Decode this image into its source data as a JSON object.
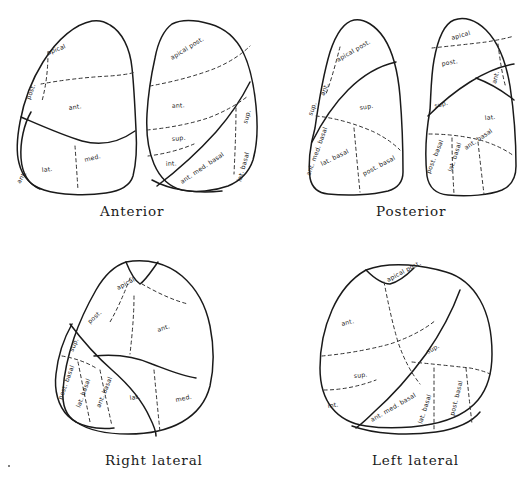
{
  "figure": {
    "background_color": "#ffffff",
    "ink_color": "#1a1a1a"
  },
  "views": [
    {
      "id": "anterior",
      "caption": "Anterior",
      "lungs": [
        {
          "side": "right-lung-as-drawn-left",
          "segments": [
            {
              "name": "apical",
              "label": "apical",
              "x": 62,
              "y": 52,
              "rot": -22
            },
            {
              "name": "posterior",
              "label": "post.",
              "x": 31,
              "y": 97,
              "rot": -68
            },
            {
              "name": "anterior",
              "label": "ant.",
              "x": 78,
              "y": 108,
              "rot": -8
            },
            {
              "name": "lateral",
              "label": "lat.",
              "x": 50,
              "y": 170,
              "rot": -6
            },
            {
              "name": "medial",
              "label": "med.",
              "x": 91,
              "y": 160,
              "rot": -14
            },
            {
              "name": "anterior-basal",
              "label": "ant.",
              "x": 22,
              "y": 178,
              "rot": -58
            }
          ]
        },
        {
          "side": "left-lung-as-drawn-right",
          "segments": [
            {
              "name": "apical-posterior",
              "label": "apical post.",
              "x": 185,
              "y": 48,
              "rot": -30
            },
            {
              "name": "anterior",
              "label": "ant.",
              "x": 182,
              "y": 106,
              "rot": -4
            },
            {
              "name": "superior-lingula",
              "label": "sup.",
              "x": 182,
              "y": 139,
              "rot": -5
            },
            {
              "name": "inferior-lingula",
              "label": "int.",
              "x": 173,
              "y": 163,
              "rot": -4
            },
            {
              "name": "anterior-medial-basal",
              "label": "ant. med. basal",
              "x": 196,
              "y": 175,
              "rot": -22
            },
            {
              "name": "lateral-basal",
              "label": "lat. basal",
              "x": 243,
              "y": 160,
              "rot": -70
            },
            {
              "name": "superior-basal",
              "label": "sup.",
              "x": 245,
              "y": 112,
              "rot": -72
            }
          ]
        }
      ]
    },
    {
      "id": "posterior",
      "caption": "Posterior",
      "lungs": [
        {
          "side": "left-lung-as-drawn-left",
          "segments": [
            {
              "name": "apical-posterior",
              "label": "apical post.",
              "x": 345,
              "y": 52,
              "rot": -28
            },
            {
              "name": "anterior",
              "label": "ant.",
              "x": 325,
              "y": 90,
              "rot": -66
            },
            {
              "name": "superior",
              "label": "sup.",
              "x": 364,
              "y": 105,
              "rot": -10
            },
            {
              "name": "superior-basal",
              "label": "sup.",
              "x": 310,
              "y": 110,
              "rot": -68
            },
            {
              "name": "anterior-medial-basal",
              "label": "ant. med. basal",
              "x": 307,
              "y": 140,
              "rot": -66
            },
            {
              "name": "lateral-basal",
              "label": "lat. basal",
              "x": 331,
              "y": 160,
              "rot": -24
            },
            {
              "name": "posterior-basal",
              "label": "post. basal",
              "x": 372,
              "y": 166,
              "rot": -28
            }
          ]
        },
        {
          "side": "right-lung-as-drawn-right",
          "segments": [
            {
              "name": "apical",
              "label": "apical",
              "x": 438,
              "y": 36,
              "rot": -16
            },
            {
              "name": "posterior",
              "label": "post.",
              "x": 430,
              "y": 62,
              "rot": -10
            },
            {
              "name": "anterior",
              "label": "ant.",
              "x": 473,
              "y": 78,
              "rot": -72
            },
            {
              "name": "superior",
              "label": "sup.",
              "x": 431,
              "y": 104,
              "rot": -14
            },
            {
              "name": "lateral",
              "label": "lat.",
              "x": 481,
              "y": 117,
              "rot": -6
            },
            {
              "name": "anterior-basal",
              "label": "ant. basal",
              "x": 470,
              "y": 142,
              "rot": -32
            },
            {
              "name": "lateral-basal",
              "label": "lat. basal",
              "x": 446,
              "y": 158,
              "rot": -70
            },
            {
              "name": "posterior-basal",
              "label": "post. basal",
              "x": 424,
              "y": 160,
              "rot": -66
            }
          ]
        }
      ]
    },
    {
      "id": "right-lateral",
      "caption": "Right lateral",
      "lungs": [
        {
          "side": "right-lung",
          "segments": [
            {
              "name": "apical",
              "label": "apical",
              "x": 122,
              "y": 285,
              "rot": -26
            },
            {
              "name": "posterior",
              "label": "post.",
              "x": 95,
              "y": 317,
              "rot": -40
            },
            {
              "name": "anterior",
              "label": "ant.",
              "x": 165,
              "y": 327,
              "rot": -16
            },
            {
              "name": "superior",
              "label": "sup.",
              "x": 77,
              "y": 347,
              "rot": -62
            },
            {
              "name": "posterior-basal",
              "label": "post. basal",
              "x": 58,
              "y": 382,
              "rot": -66
            },
            {
              "name": "lateral-basal",
              "label": "lat. basal",
              "x": 77,
              "y": 398,
              "rot": -68
            },
            {
              "name": "anterior-basal",
              "label": "ant. basal",
              "x": 98,
              "y": 400,
              "rot": -66
            },
            {
              "name": "lateral",
              "label": "lat.",
              "x": 136,
              "y": 393,
              "rot": -8
            },
            {
              "name": "medial",
              "label": "med.",
              "x": 181,
              "y": 398,
              "rot": -12
            }
          ]
        }
      ]
    },
    {
      "id": "left-lateral",
      "caption": "Left lateral",
      "lungs": [
        {
          "side": "left-lung",
          "segments": [
            {
              "name": "apical-posterior",
              "label": "apical post.",
              "x": 392,
              "y": 278,
              "rot": -26
            },
            {
              "name": "anterior",
              "label": "ant.",
              "x": 346,
              "y": 322,
              "rot": -14
            },
            {
              "name": "superior-lingula",
              "label": "sup.",
              "x": 358,
              "y": 375,
              "rot": -6
            },
            {
              "name": "inferior-lingula",
              "label": "int.",
              "x": 329,
              "y": 405,
              "rot": -8
            },
            {
              "name": "superior-basal",
              "label": "sup.",
              "x": 434,
              "y": 348,
              "rot": -28
            },
            {
              "name": "anterior-medial-basal",
              "label": "ant. med. basal",
              "x": 377,
              "y": 410,
              "rot": -26
            },
            {
              "name": "lateral-basal",
              "label": "lat. basal",
              "x": 431,
              "y": 410,
              "rot": -70
            },
            {
              "name": "posterior-basal",
              "label": "post. basal",
              "x": 460,
              "y": 400,
              "rot": -74
            }
          ]
        }
      ]
    }
  ],
  "captions": {
    "anterior": {
      "text": "Anterior",
      "x": 100,
      "y": 203
    },
    "posterior": {
      "text": "Posterior",
      "x": 376,
      "y": 203
    },
    "right_lateral": {
      "text": "Right lateral",
      "x": 105,
      "y": 452
    },
    "left_lateral": {
      "text": "Left lateral",
      "x": 372,
      "y": 452
    }
  }
}
